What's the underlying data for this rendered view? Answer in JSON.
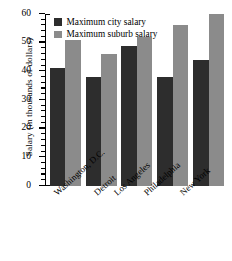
{
  "chart_data": {
    "type": "bar",
    "title": "",
    "xlabel": "",
    "ylabel": "Salary (in thousands of dollars)",
    "categories": [
      "Washington, D.C.",
      "Detroit",
      "Los Angeles",
      "Philadelphia",
      "New York"
    ],
    "series": [
      {
        "name": "Maximum city salary",
        "color": "#2d2d2d",
        "values": [
          41,
          38,
          49,
          38,
          44
        ]
      },
      {
        "name": "Maximum suburb salary",
        "color": "#8b8b8b",
        "values": [
          51,
          46,
          52,
          56,
          60
        ]
      }
    ],
    "ylim": [
      0,
      60
    ],
    "ytick_labels": [
      "0",
      "10",
      "20",
      "30",
      "40",
      "50",
      "60"
    ],
    "ytick_values": [
      0,
      10,
      20,
      30,
      40,
      50,
      60
    ],
    "yminor_interval": 2,
    "grid": false,
    "legend_position": "upper left"
  },
  "legend": {
    "items": [
      {
        "label": "Maximum city salary"
      },
      {
        "label": "Maximum suburb salary"
      }
    ]
  },
  "axis": {
    "y_title": "Salary (in thousands of dollars)"
  }
}
